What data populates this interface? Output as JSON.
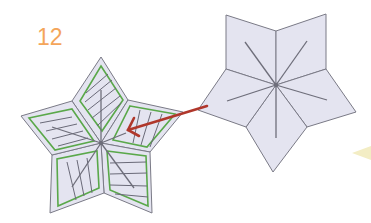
{
  "step_number": "12",
  "colors": {
    "step_number": "#f4a55a",
    "rhombus_fill": "#e4e4f0",
    "rhombus_stroke": "#7a7a86",
    "inset_outline": "#5aa84a",
    "hatch": "#6a6a78",
    "arrow": "#b0372b",
    "crease": "#6e6e7a",
    "wedge": "#f3edc4"
  },
  "figures": [
    {
      "name": "folded-star",
      "orientation": "point-up",
      "pieces": 5,
      "detail": "green inset outlines with hatch lines"
    },
    {
      "name": "flat-star",
      "orientation": "point-down",
      "pieces": 5,
      "detail": "radial crease lines"
    }
  ],
  "arrow": {
    "from": "flat-star",
    "to": "folded-star"
  }
}
